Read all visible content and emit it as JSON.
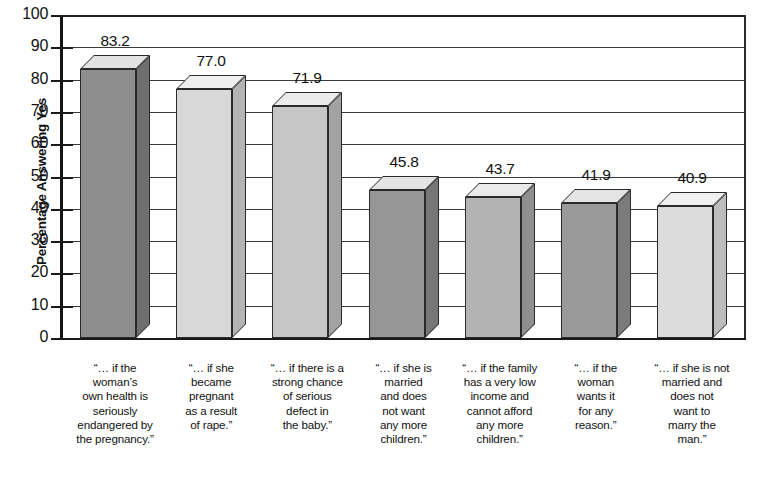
{
  "chart_data": {
    "type": "bar",
    "title": "",
    "subtitle": "",
    "xlabel": "",
    "ylabel": "Percentage Answering Yes",
    "ylim": [
      0,
      100
    ],
    "ytick_step": 10,
    "yticks": [
      "100",
      "90",
      "80",
      "70",
      "60",
      "50",
      "40",
      "30",
      "20",
      "10",
      "0"
    ],
    "grid": true,
    "grid_axis": "y",
    "legend": "none",
    "three_d": true,
    "categories": [
      "“… if the woman’s own health is seriously endangered by the pregnancy.”",
      "“… if she became pregnant as a result of rape.”",
      "“… if there is a strong chance of serious defect in the baby.”",
      "“… if she is married and does not want any more children.”",
      "“… if the family has a very low income and cannot afford any more children.”",
      "“… if the woman wants it for any reason.”",
      "“… if she is not married and does not want to marry the man.”"
    ],
    "values": [
      83.2,
      77.0,
      71.9,
      45.8,
      43.7,
      41.9,
      40.9
    ],
    "value_labels": [
      "83.2",
      "77.0",
      "71.9",
      "45.8",
      "43.7",
      "41.9",
      "40.9"
    ],
    "bar_colors": [
      "#8e8e8e",
      "#d8d8d8",
      "#c6c6c6",
      "#969696",
      "#b3b3b3",
      "#9a9a9a",
      "#dcdcdc"
    ],
    "bar_top_colors": [
      "#e2e2e2",
      "#efefef",
      "#ebebeb",
      "#e4e4e4",
      "#eaeaea",
      "#e4e4e4",
      "#f0f0f0"
    ],
    "bar_side_colors": [
      "#6f6f6f",
      "#b4b4b4",
      "#a2a2a2",
      "#767676",
      "#8f8f8f",
      "#7b7b7b",
      "#bdbdbd"
    ]
  },
  "category_lines": [
    [
      "“… if the",
      "woman’s",
      "own health is",
      "seriously",
      "endangered by",
      "the pregnancy.”"
    ],
    [
      "“… if she",
      "became",
      "pregnant",
      "as a result",
      "of rape.”"
    ],
    [
      "“… if there is a",
      "strong chance",
      "of serious",
      "defect in",
      "the baby.”"
    ],
    [
      "“… if she is",
      "married",
      "and does",
      "not want",
      "any more",
      "children.”"
    ],
    [
      "“… if the family",
      "has a very low",
      "income and",
      "cannot afford",
      "any more",
      "children.”"
    ],
    [
      "“… if the",
      "woman",
      "wants it",
      "for any",
      "reason.”"
    ],
    [
      "“… if she is not",
      "married and",
      "does not",
      "want to",
      "marry the",
      "man.”"
    ]
  ]
}
